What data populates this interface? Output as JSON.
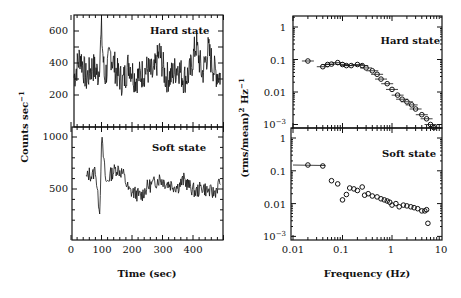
{
  "chart_data": [
    {
      "type": "line",
      "panel": "left-top",
      "title": "",
      "annotation": "Hard state",
      "xlabel": "Time (sec)",
      "ylabel": "Counts sec^-1",
      "xlim": [
        0,
        500
      ],
      "ylim": [
        100,
        700
      ],
      "yticks": [
        200,
        400,
        600
      ],
      "description": "Noisy light curve fluctuating around ~320 counts/s, range ~180-600",
      "x": [
        10,
        30,
        50,
        70,
        90,
        100,
        110,
        130,
        150,
        170,
        190,
        210,
        230,
        250,
        270,
        290,
        310,
        330,
        350,
        370,
        390,
        410,
        430,
        450,
        470,
        490
      ],
      "values": [
        310,
        450,
        300,
        380,
        330,
        590,
        300,
        460,
        340,
        280,
        400,
        300,
        330,
        360,
        320,
        470,
        310,
        320,
        380,
        300,
        340,
        520,
        330,
        480,
        350,
        320
      ]
    },
    {
      "type": "line",
      "panel": "left-bottom",
      "annotation": "Soft state",
      "xlabel": "Time (sec)",
      "ylabel": "Counts sec^-1",
      "xlim": [
        0,
        500
      ],
      "ylim": [
        100,
        1100
      ],
      "yticks": [
        500,
        1000
      ],
      "xticks": [
        0,
        100,
        200,
        300,
        400
      ],
      "description": "Light curve starting ~t=50 s around 600 counts/s, spike ~1000 near t=100, dip ~300 near t=90, then ~450-600",
      "x": [
        50,
        60,
        70,
        80,
        88,
        95,
        100,
        105,
        115,
        130,
        150,
        170,
        190,
        210,
        230,
        250,
        270,
        290,
        310,
        330,
        350,
        370,
        390,
        410,
        430,
        450,
        470,
        490
      ],
      "values": [
        600,
        650,
        620,
        700,
        420,
        300,
        1000,
        850,
        550,
        640,
        700,
        650,
        480,
        460,
        430,
        520,
        550,
        600,
        560,
        540,
        520,
        590,
        520,
        470,
        520,
        480,
        460,
        580
      ]
    },
    {
      "type": "scatter",
      "panel": "right-top",
      "annotation": "Hard state",
      "xlabel": "Frequency (Hz)",
      "ylabel": "(rms/mean)^2 Hz^-1",
      "xscale": "log",
      "yscale": "log",
      "xlim": [
        0.01,
        10
      ],
      "ylim": [
        0.0006,
        2
      ],
      "yticks": [
        "1",
        "0.1",
        "0.01",
        "10^-3"
      ],
      "x": [
        0.02,
        0.04,
        0.05,
        0.06,
        0.08,
        0.1,
        0.12,
        0.15,
        0.2,
        0.25,
        0.3,
        0.4,
        0.5,
        0.6,
        0.8,
        1.0,
        1.3,
        1.6,
        2.0,
        2.5,
        3.0,
        4.0,
        5.0,
        6.0,
        7.0
      ],
      "values": [
        0.09,
        0.06,
        0.07,
        0.072,
        0.08,
        0.07,
        0.065,
        0.065,
        0.07,
        0.065,
        0.055,
        0.045,
        0.035,
        0.025,
        0.018,
        0.012,
        0.008,
        0.006,
        0.005,
        0.004,
        0.003,
        0.002,
        0.0015,
        0.001,
        0.0008
      ]
    },
    {
      "type": "scatter",
      "panel": "right-bottom",
      "annotation": "Soft state",
      "xlabel": "Frequency (Hz)",
      "ylabel": "(rms/mean)^2 Hz^-1",
      "xscale": "log",
      "yscale": "log",
      "xlim": [
        0.01,
        10
      ],
      "ylim": [
        0.0006,
        2
      ],
      "xticks": [
        "0.01",
        "0.1",
        "1",
        "10"
      ],
      "yticks": [
        "1",
        "0.1",
        "0.01",
        "10^-3"
      ],
      "x": [
        0.02,
        0.04,
        0.06,
        0.08,
        0.1,
        0.12,
        0.14,
        0.17,
        0.2,
        0.25,
        0.28,
        0.33,
        0.4,
        0.5,
        0.6,
        0.7,
        0.8,
        0.9,
        1.0,
        1.2,
        1.4,
        1.7,
        2.0,
        2.4,
        2.8,
        3.3,
        4.0,
        4.6,
        5.0,
        5.3
      ],
      "values": [
        0.15,
        0.14,
        0.05,
        0.04,
        0.013,
        0.019,
        0.03,
        0.028,
        0.025,
        0.032,
        0.018,
        0.02,
        0.017,
        0.016,
        0.014,
        0.013,
        0.012,
        0.011,
        0.009,
        0.01,
        0.008,
        0.009,
        0.0085,
        0.008,
        0.0075,
        0.007,
        0.006,
        0.006,
        0.0065,
        0.0025
      ]
    }
  ],
  "labels": {
    "left_ylabel": "Counts sec",
    "left_ylabel_sup": "−1",
    "left_xlabel": "Time (sec)",
    "right_ylabel": "(rms/mean)",
    "right_ylabel_sup": "2",
    "right_ylabel_unit": " Hz",
    "right_ylabel_sup2": "−1",
    "right_xlabel": "Frequency (Hz)",
    "hard_state": "Hard state",
    "soft_state": "Soft state"
  },
  "ticks": {
    "left_top_y": [
      "600",
      "400",
      "200"
    ],
    "left_bottom_y": [
      "1000",
      "500"
    ],
    "left_x": [
      "0",
      "100",
      "200",
      "300",
      "400"
    ],
    "right_y": [
      "1",
      "0.1",
      "0.01"
    ],
    "right_y_exp_base": "10",
    "right_y_exp": "−3",
    "right_x": [
      "0.01",
      "0.1",
      "1",
      "10"
    ]
  }
}
